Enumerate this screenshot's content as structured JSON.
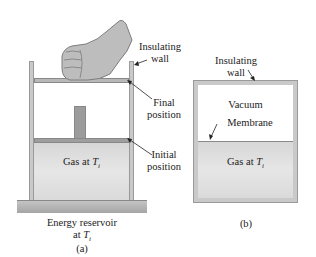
{
  "figure_a": {
    "caption": "(a)",
    "labels": {
      "insulating_wall_line1": "Insulating",
      "insulating_wall_line2": "wall",
      "final_position_line1": "Final",
      "final_position_line2": "position",
      "initial_position_line1": "Initial",
      "initial_position_line2": "position",
      "gas": "Gas at ",
      "gas_temp_symbol": "T",
      "gas_temp_subscript": "i",
      "reservoir_line1": "Energy reservoir",
      "reservoir_line2": "at ",
      "reservoir_temp_symbol": "T",
      "reservoir_temp_subscript": "i"
    },
    "icons": [
      "hand-fist-icon"
    ]
  },
  "figure_b": {
    "caption": "(b)",
    "labels": {
      "insulating_wall_line1": "Insulating",
      "insulating_wall_line2": "wall",
      "vacuum": "Vacuum",
      "membrane": "Membrane",
      "gas": "Gas at ",
      "gas_temp_symbol": "T",
      "gas_temp_subscript": "i"
    }
  },
  "colors": {
    "wall": "#c9c9c9",
    "piston": "#a9a9a9",
    "gas": "#dedede",
    "reservoir": "#b5b5b5"
  }
}
